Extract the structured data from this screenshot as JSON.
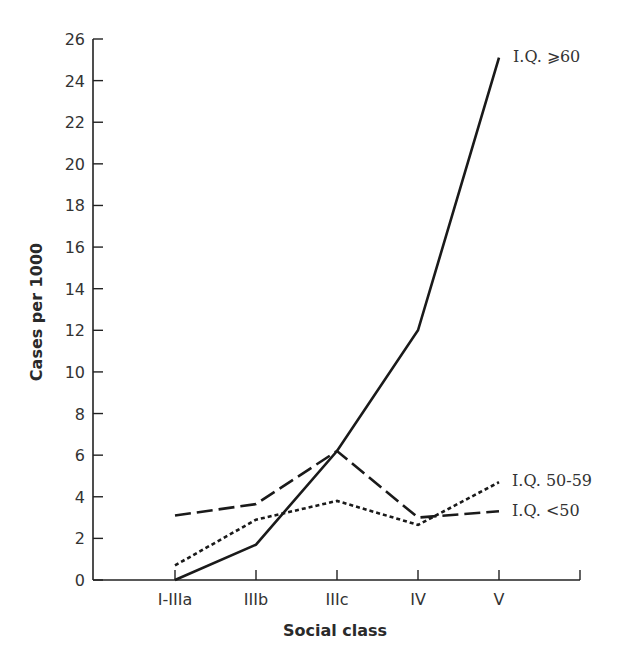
{
  "chart_data": {
    "type": "line",
    "title": "",
    "xlabel": "Social class",
    "ylabel": "Cases per 1000",
    "categories": [
      "I-IIIa",
      "IIIb",
      "IIIc",
      "IV",
      "V"
    ],
    "ylim": [
      0,
      26
    ],
    "yticks": [
      0,
      2,
      4,
      6,
      8,
      10,
      12,
      14,
      16,
      18,
      20,
      22,
      24,
      26
    ],
    "grid": false,
    "legend_position": "inline labels at line ends (right)",
    "series": [
      {
        "name": "I.Q. ⩾60",
        "style": "solid",
        "values": [
          0,
          1.7,
          6.2,
          12,
          25.1
        ]
      },
      {
        "name": "I.Q. 50-59",
        "style": "dotted",
        "values": [
          0.7,
          2.9,
          3.8,
          2.65,
          4.7
        ]
      },
      {
        "name": "I.Q. <50",
        "style": "dashed",
        "values": [
          3.1,
          3.65,
          6.2,
          3.0,
          3.3
        ]
      }
    ]
  },
  "colors": {
    "line": "#1a1a1a",
    "axis": "#222222",
    "text": "#333333"
  }
}
